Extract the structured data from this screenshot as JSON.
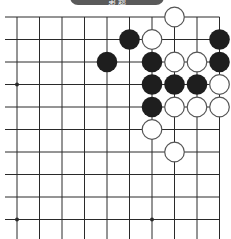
{
  "banner": {
    "label": "第 题"
  },
  "board": {
    "grid_origin_x": 17,
    "grid_origin_y": 17,
    "spacing": 22.5,
    "cols": 10,
    "rows": 10,
    "line_color": "#2a2a2a",
    "black_color": "#1e1e1e",
    "white_fill": "#ffffff",
    "white_stroke": "#555555",
    "star_points": [
      [
        0,
        3
      ],
      [
        0,
        9
      ],
      [
        6,
        9
      ]
    ],
    "stones": [
      {
        "color": "white",
        "col": 7,
        "row": 0
      },
      {
        "color": "black",
        "col": 5,
        "row": 1
      },
      {
        "color": "white",
        "col": 6,
        "row": 1
      },
      {
        "color": "black",
        "col": 9,
        "row": 1
      },
      {
        "color": "black",
        "col": 4,
        "row": 2
      },
      {
        "color": "black",
        "col": 6,
        "row": 2
      },
      {
        "color": "white",
        "col": 7,
        "row": 2
      },
      {
        "color": "white",
        "col": 8,
        "row": 2
      },
      {
        "color": "black",
        "col": 9,
        "row": 2
      },
      {
        "color": "black",
        "col": 6,
        "row": 3
      },
      {
        "color": "black",
        "col": 7,
        "row": 3
      },
      {
        "color": "black",
        "col": 8,
        "row": 3
      },
      {
        "color": "white",
        "col": 9,
        "row": 3
      },
      {
        "color": "black",
        "col": 6,
        "row": 4
      },
      {
        "color": "white",
        "col": 7,
        "row": 4
      },
      {
        "color": "white",
        "col": 8,
        "row": 4
      },
      {
        "color": "white",
        "col": 9,
        "row": 4
      },
      {
        "color": "white",
        "col": 6,
        "row": 5
      },
      {
        "color": "white",
        "col": 7,
        "row": 6
      }
    ]
  }
}
